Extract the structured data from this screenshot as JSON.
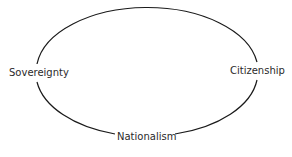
{
  "diagram": {
    "type": "cycle",
    "shape": "ellipse",
    "nodes": [
      {
        "id": "sovereignty",
        "label": "Sovereignty",
        "position": "left"
      },
      {
        "id": "citizenship",
        "label": "Citizenship",
        "position": "right"
      },
      {
        "id": "nationalism",
        "label": "Nationalism",
        "position": "bottom"
      }
    ],
    "colors": {
      "stroke": "#1a1a1a",
      "text": "#2a2a2a",
      "background": "#ffffff"
    }
  }
}
